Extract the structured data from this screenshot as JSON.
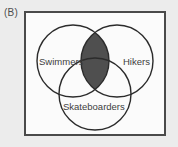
{
  "figure": {
    "panel_label": "(B)",
    "type": "venn-diagram",
    "set_count": 3,
    "frame_border_color": "#4a4a4a",
    "frame_fill_color": "#fbfbfb",
    "background_color": "#ececec",
    "circle_stroke_color": "#2b2b2b",
    "circle_fill_color": "none",
    "shaded_region_color": "#4f4f4f",
    "label_text_color": "#3d3d3d",
    "sets": [
      {
        "id": "swimmers",
        "label": "Swimmers",
        "position": "top-left",
        "label_x": 36,
        "label_y": 59,
        "cx": 47,
        "cy": 48,
        "r": 36
      },
      {
        "id": "hikers",
        "label": "Hikers",
        "position": "top-right",
        "label_x": 88,
        "label_y": 59,
        "cx": 91,
        "cy": 48,
        "r": 36
      },
      {
        "id": "skateboarders",
        "label": "Skateboarders",
        "position": "bottom-center",
        "label_x": 34,
        "label_y": 100,
        "cx": 69,
        "cy": 81,
        "r": 36
      }
    ],
    "shaded_regions": [
      {
        "id": "swimmers-and-hikers",
        "description": "Intersection of Swimmers and Hikers (includes the central three-way overlap)",
        "members": [
          "swimmers",
          "hikers"
        ],
        "fill": "#4f4f4f"
      }
    ]
  }
}
